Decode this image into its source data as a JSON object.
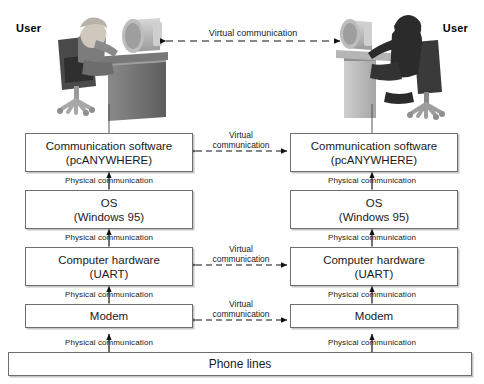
{
  "diagram": {
    "colors": {
      "box_border": "#6e6e6e",
      "background": "#ffffff",
      "text": "#1a1a1a",
      "arrow": "#111111",
      "figure_dark": "#3a3a3a",
      "figure_mid": "#8c8c8c",
      "figure_light": "#c9c9c9"
    },
    "users": {
      "left_label": "User",
      "right_label": "User"
    },
    "top_link": {
      "label": "Virtual communication",
      "style": "dashed-double-arrow"
    },
    "layers": [
      {
        "id": "communication-software",
        "line1": "Communication software",
        "line2": "(pcANYWHERE)",
        "virtual_link": "Virtual communication"
      },
      {
        "id": "os",
        "line1": "OS",
        "line2": "(Windows 95)",
        "virtual_link": ""
      },
      {
        "id": "computer-hardware",
        "line1": "Computer hardware",
        "line2": "(UART)",
        "virtual_link": "Virtual communication"
      },
      {
        "id": "modem",
        "line1": "Modem",
        "line2": "",
        "virtual_link": "Virtual communication"
      }
    ],
    "physical_label": "Physical communication",
    "physical_labels": {
      "l1": "Physical communication",
      "l2": "Physical communication",
      "l3": "Physical communication",
      "l4": "Physical communication",
      "r1": "Physical communication",
      "r2": "Physical communication",
      "r3": "Physical communication",
      "r4": "Physical communication"
    },
    "virtual_labels": {
      "top": "Virtual communication",
      "software_1": "Virtual",
      "software_2": "communication",
      "hardware_1": "Virtual",
      "hardware_2": "communication",
      "modem_1": "Virtual",
      "modem_2": "communication"
    },
    "bottom_bar": {
      "label": "Phone lines"
    }
  }
}
